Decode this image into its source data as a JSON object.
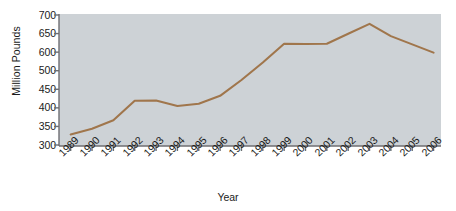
{
  "chart_data": {
    "type": "line",
    "title": "",
    "xlabel": "Year",
    "ylabel": "Million Pounds",
    "categories": [
      "1989",
      "1990",
      "1991",
      "1992",
      "1993",
      "1994",
      "1995",
      "1996",
      "1997",
      "1998",
      "1999",
      "2000",
      "2001",
      "2002",
      "2003",
      "2004",
      "2005",
      "2006"
    ],
    "values": [
      335,
      352,
      378,
      437,
      438,
      421,
      428,
      452,
      500,
      553,
      610,
      609,
      610,
      640,
      670,
      633,
      608,
      583
    ],
    "series": [
      {
        "name": "Million Pounds",
        "values": [
          335,
          352,
          378,
          437,
          438,
          421,
          428,
          452,
          500,
          553,
          610,
          609,
          610,
          640,
          670,
          633,
          608,
          583
        ]
      }
    ],
    "ylim": [
      300,
      700
    ],
    "y_tick_labels": [
      "700",
      "650",
      "600",
      "500",
      "450",
      "400",
      "350",
      "300"
    ],
    "y_tick_values": [
      700,
      650,
      600,
      550,
      450,
      400,
      350,
      300
    ],
    "grid": false,
    "legend": "none",
    "line_color": "#a0764c",
    "plot_background": "#cdd2d6",
    "axis_color": "#6e6e72",
    "text_color": "#1b1b1b"
  }
}
